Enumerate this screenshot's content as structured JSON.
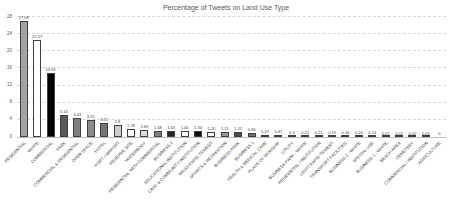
{
  "chart": {
    "title": "Percentage of Tweets on Land Use Type"
  },
  "chart_data": {
    "type": "bar",
    "title": "Percentage of Tweets on Land Use Type",
    "xlabel": "",
    "ylabel": "",
    "ylim": [
      0,
      28
    ],
    "yticks": [
      0,
      4,
      8,
      12,
      16,
      20,
      24,
      28
    ],
    "grid": "dashed-horizontal",
    "legend": "none",
    "categories": [
      "RESIDENTIAL",
      "WHITE",
      "COMMERCIAL",
      "PARK",
      "COMMERCIAL & RESIDENTIAL",
      "OPEN SPACE",
      "HOTEL",
      "PORT / AIRPORT",
      "RESERVE SITE",
      "WATERBODY",
      "RESIDENTIAL WITH COMMERCIAL",
      "BUSINESS 2",
      "EDUCATIONAL INSTITUTION",
      "CIVIC & COMMUNITY INSTITUTION",
      "MASS RAPID TRANSIT",
      "SPORTS & RECREATION",
      "BUSINESS PARK",
      "BUSINESS 1",
      "HEALTH & MEDICAL CARE",
      "PLACE OF WORSHIP",
      "UTILITY",
      "BUSINESS PARK - WHITE",
      "RESIDENTIAL / INSTITUTION",
      "LIGHT RAPID TRANSIT",
      "TRANSPORT FACILITIES",
      "BUSINESS 2 - WHITE",
      "SPECIAL USE",
      "BUSINESS 1 - WHITE",
      "BEACH AREA",
      "CEMETERY",
      "COMMERCIAL / INSTITUTION",
      "AGRICULTURE"
    ],
    "values": [
      27.08,
      22.57,
      14.93,
      5.14,
      4.43,
      3.91,
      3.21,
      2.8,
      1.78,
      1.69,
      1.48,
      1.43,
      1.4,
      1.34,
      1.2,
      1.15,
      1.12,
      0.96,
      0.47,
      0.47,
      0.3,
      0.21,
      0.21,
      0.19,
      0.16,
      0.16,
      0.14,
      0.07,
      0.02,
      0.02,
      0.02,
      0
    ],
    "value_labels": [
      "27.08",
      "22.57",
      "14.93",
      "5.14",
      "4.43",
      "3.91",
      "3.21",
      "2.8",
      "1.78",
      "1.69",
      "1.48",
      "1.43",
      "1.40",
      "1.34",
      "1.20",
      "1.15",
      "1.12",
      "0.96",
      "0.47",
      "0.47",
      "0.3",
      "0.21",
      "0.21",
      "0.19",
      "0.16",
      "0.16",
      "0.14",
      "0.07",
      "0.02",
      "0.02",
      "0.02",
      "0"
    ],
    "bar_colors": [
      "#a3a3a3",
      "#ffffff",
      "#000000",
      "#595959",
      "#7f7f7f",
      "#8c8c8c",
      "#757575",
      "#cccccc",
      "#ffffff",
      "#d9d9d9",
      "#808080",
      "#262626",
      "#ffffff",
      "#0d0d0d",
      "#ffffff",
      "#999999",
      "#4d4d4d",
      "#737373",
      "#1a1a1a",
      "#404040",
      "#333333",
      "#000000",
      "#1a1a1a",
      "#4d4d4d",
      "#808080",
      "#333333",
      "#000000",
      "#666666",
      "#1a1a1a",
      "#333333",
      "#737373",
      "#a6a6a6"
    ],
    "bar_border_color": "#3f3f3f",
    "gridline_color": "#d9d9d9",
    "axis_text_color": "#595959",
    "title_color": "#595959"
  }
}
